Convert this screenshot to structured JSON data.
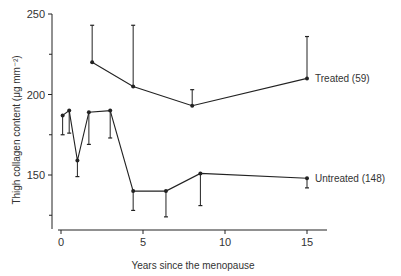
{
  "chart_data": {
    "type": "line",
    "title": "",
    "xlabel": "Years since the menopause",
    "ylabel": "Thigh collagen content (μg mm⁻²)",
    "xlim": [
      0,
      16
    ],
    "ylim": [
      120,
      250
    ],
    "x_ticks": [
      0,
      5,
      10,
      15
    ],
    "y_ticks": [
      150,
      200,
      250
    ],
    "y_minor_ticks": [
      125,
      175,
      225
    ],
    "grid": false,
    "series": [
      {
        "name": "Treated (59)",
        "x": [
          1.9,
          4.4,
          8.0,
          15.0
        ],
        "values": [
          220,
          205,
          193,
          210
        ],
        "error_upper": [
          243,
          243,
          203,
          236
        ],
        "error_direction": "up"
      },
      {
        "name": "Untreated (148)",
        "x": [
          0.1,
          0.5,
          1.0,
          1.7,
          3.0,
          4.4,
          6.4,
          8.5,
          15.0
        ],
        "values": [
          187,
          190,
          159,
          189,
          190,
          140,
          140,
          151,
          148
        ],
        "error_lower": [
          175,
          176,
          149,
          169,
          173,
          128,
          124,
          131,
          142
        ],
        "error_direction": "down"
      }
    ],
    "annotations": [
      "Treated (59)",
      "Untreated (148)"
    ]
  }
}
